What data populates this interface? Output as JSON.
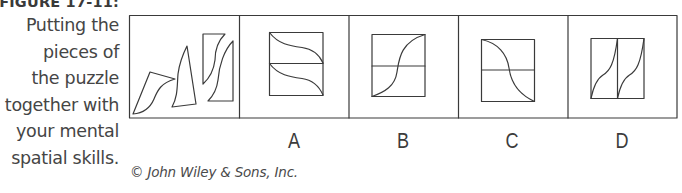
{
  "caption": {
    "title": "FIGURE 17-11:",
    "lines": [
      "Putting the",
      "pieces of",
      "the puzzle",
      "together with",
      "your mental",
      "spatial skills."
    ]
  },
  "figure": {
    "panels": [
      {
        "id": "pieces",
        "label": "",
        "description": "three puzzle pieces"
      },
      {
        "id": "A",
        "label": "A",
        "description": "square split horizontally, two S-curves descending left to right"
      },
      {
        "id": "B",
        "label": "B",
        "description": "square split horizontally, single S-curve rising from bottom-left to top-right"
      },
      {
        "id": "C",
        "label": "C",
        "description": "square split horizontally, single S-curve descending from top-left to bottom-right"
      },
      {
        "id": "D",
        "label": "D",
        "description": "rectangle split vertically, two S-curves rising bottom-left to top-right"
      }
    ],
    "stroke_color": "#3a3a3a"
  },
  "credit": "© John Wiley & Sons, Inc."
}
